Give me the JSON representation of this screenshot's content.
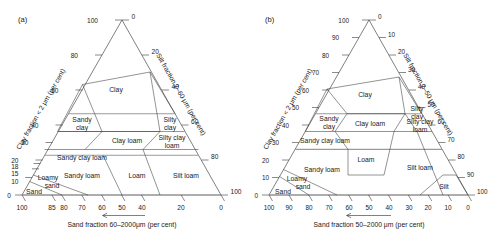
{
  "figure": {
    "type": "soil-texture-triangle-pair",
    "panels": [
      {
        "id": "a",
        "label": "(a)",
        "axes": {
          "bottom": {
            "title": "Sand fraction 60–2000μm (per cent)",
            "ticks": [
              100,
              85,
              80,
              70,
              60,
              50,
              40,
              20,
              0
            ],
            "direction": "right-to-left"
          },
          "left": {
            "title": "Clay fraction < 2 μm (per cent)",
            "ticks": [
              0,
              10,
              15,
              18,
              20,
              30,
              40,
              60,
              80,
              100
            ]
          },
          "right": {
            "title": "Silt fraction 2–60 μm (per cent)",
            "ticks": [
              0,
              20,
              40,
              60,
              80,
              100
            ]
          }
        },
        "regions": [
          "Clay",
          "Sandy clay",
          "Silty clay",
          "Clay loam",
          "Silty clay loam",
          "Sandy clay loam",
          "Sandy loam",
          "Loam",
          "Silt loam",
          "Loamy sand",
          "Sand"
        ]
      },
      {
        "id": "b",
        "label": "(b)",
        "axes": {
          "bottom": {
            "title": "Sand fraction 50–2000 μm (per cent)",
            "ticks": [
              100,
              90,
              80,
              70,
              60,
              50,
              40,
              30,
              20,
              10,
              0
            ],
            "direction": "right-to-left"
          },
          "left": {
            "title": "Clay fraction < 2 μm (per cent)",
            "ticks": [
              0,
              10,
              20,
              30,
              40,
              50,
              60,
              70,
              80,
              90,
              100
            ]
          },
          "right": {
            "title": "Silt fraction 2–50 μm (per cent)",
            "ticks": [
              0,
              10,
              20,
              30,
              40,
              50,
              60,
              70,
              80,
              90,
              100
            ]
          }
        },
        "regions": [
          "Clay",
          "Sandy clay",
          "Silty clay",
          "Clay loam",
          "Silty clay loam",
          "Sandy clay loam",
          "Sandy loam",
          "Loam",
          "Silt loam",
          "Silt",
          "Loamy sand",
          "Sand"
        ]
      }
    ],
    "colors": {
      "line": "#2b2b2b",
      "grey_line": "#9a9a9a",
      "text": "#1a1a1a",
      "background": "#ffffff"
    }
  }
}
